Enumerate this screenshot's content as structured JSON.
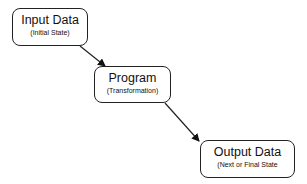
{
  "diagram": {
    "nodes": [
      {
        "id": "input",
        "title": "Input Data",
        "subtitle": "(Initial State)"
      },
      {
        "id": "program",
        "title": "Program",
        "subtitle": "(Transformation)"
      },
      {
        "id": "output",
        "title": "Output Data",
        "subtitle": "(Next or Final State"
      }
    ],
    "edges": [
      {
        "from": "input",
        "to": "program"
      },
      {
        "from": "program",
        "to": "output"
      }
    ]
  }
}
